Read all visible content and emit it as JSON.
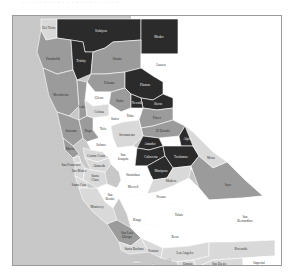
{
  "figure": {
    "caption_top": "· · · · · · · · · · · · · · · · · · · · · ·"
  },
  "legend_shades": {
    "dark": "#2b2b2b",
    "medium": "#9b9b9b",
    "light": "#d9d9d9",
    "white": "#ffffff",
    "ocean": "#c8c8c8",
    "border": "#8c8c8c"
  },
  "counties": [
    {
      "name": "Del Norte",
      "shade": "light"
    },
    {
      "name": "Siskiyou",
      "shade": "dark"
    },
    {
      "name": "Modoc",
      "shade": "dark"
    },
    {
      "name": "Humboldt",
      "shade": "medium"
    },
    {
      "name": "Trinity",
      "shade": "dark"
    },
    {
      "name": "Shasta",
      "shade": "medium"
    },
    {
      "name": "Lassen",
      "shade": "white"
    },
    {
      "name": "Tehama",
      "shade": "medium"
    },
    {
      "name": "Plumas",
      "shade": "dark"
    },
    {
      "name": "Mendocino",
      "shade": "medium"
    },
    {
      "name": "Glenn",
      "shade": "white"
    },
    {
      "name": "Butte",
      "shade": "medium"
    },
    {
      "name": "Sierra",
      "shade": "dark"
    },
    {
      "name": "Lake",
      "shade": "medium"
    },
    {
      "name": "Colusa",
      "shade": "light"
    },
    {
      "name": "Yuba",
      "shade": "white"
    },
    {
      "name": "Nevada",
      "shade": "dark"
    },
    {
      "name": "Placer",
      "shade": "medium"
    },
    {
      "name": "Sutter",
      "shade": "white"
    },
    {
      "name": "Yolo",
      "shade": "white"
    },
    {
      "name": "Sonoma",
      "shade": "medium"
    },
    {
      "name": "Napa",
      "shade": "medium"
    },
    {
      "name": "El Dorado",
      "shade": "medium"
    },
    {
      "name": "Sacramento",
      "shade": "light"
    },
    {
      "name": "Solano",
      "shade": "white"
    },
    {
      "name": "Amador",
      "shade": "dark"
    },
    {
      "name": "Alpine",
      "shade": "dark"
    },
    {
      "name": "Marin",
      "shade": "medium"
    },
    {
      "name": "Contra Costa",
      "shade": "light"
    },
    {
      "name": "San Joaquin",
      "shade": "white"
    },
    {
      "name": "Calaveras",
      "shade": "dark"
    },
    {
      "name": "Tuolumne",
      "shade": "dark"
    },
    {
      "name": "Mono",
      "shade": "light"
    },
    {
      "name": "San Francisco",
      "shade": "light"
    },
    {
      "name": "Alameda",
      "shade": "light"
    },
    {
      "name": "Stanislaus",
      "shade": "white"
    },
    {
      "name": "Mariposa",
      "shade": "dark"
    },
    {
      "name": "San Mateo",
      "shade": "light"
    },
    {
      "name": "Santa Clara",
      "shade": "light"
    },
    {
      "name": "Merced",
      "shade": "white"
    },
    {
      "name": "Madera",
      "shade": "light"
    },
    {
      "name": "Santa Cruz",
      "shade": "light"
    },
    {
      "name": "San Benito",
      "shade": "white"
    },
    {
      "name": "Fresno",
      "shade": "white"
    },
    {
      "name": "Inyo",
      "shade": "medium"
    },
    {
      "name": "Monterey",
      "shade": "light"
    },
    {
      "name": "Kings",
      "shade": "white"
    },
    {
      "name": "Tulare",
      "shade": "white"
    },
    {
      "name": "San Luis Obispo",
      "shade": "medium"
    },
    {
      "name": "Kern",
      "shade": "white"
    },
    {
      "name": "San Bernardino",
      "shade": "white"
    },
    {
      "name": "Santa Barbara",
      "shade": "light"
    },
    {
      "name": "Ventura",
      "shade": "light"
    },
    {
      "name": "Los Angeles",
      "shade": "light"
    },
    {
      "name": "Orange",
      "shade": "light"
    },
    {
      "name": "Riverside",
      "shade": "light"
    },
    {
      "name": "San Diego",
      "shade": "light"
    },
    {
      "name": "Imperial",
      "shade": "white"
    }
  ],
  "labels": {
    "del_norte": "Del Norte",
    "siskiyou": "Siskiyou",
    "modoc": "Modoc",
    "humboldt": "Humboldt",
    "trinity": "Trinity",
    "shasta": "Shasta",
    "lassen": "Lassen",
    "tehama": "Tehama",
    "plumas": "Plumas",
    "mendocino": "Mendocino",
    "glenn": "Glenn",
    "butte": "Butte",
    "sierra": "Sierra",
    "lake": "Lake",
    "colusa": "Colusa",
    "yuba": "Yuba",
    "nevada": "Nevada",
    "placer": "Placer",
    "sutter": "Sutter",
    "yolo": "Yolo",
    "sonoma": "Sonoma",
    "napa": "Napa",
    "el_dorado": "El Dorado",
    "sacramento": "Sacramento",
    "solano": "Solano",
    "amador": "Amador",
    "alpine": "Alpine",
    "marin": "Marin",
    "contra_costa": "Contra Costa",
    "san_joaquin_1": "San",
    "san_joaquin_2": "Joaquin",
    "calaveras": "Calaveras",
    "tuolumne": "Tuolumne",
    "mono": "Mono",
    "san_francisco": "San Francisco",
    "alameda": "Alameda",
    "stanislaus": "Stanislaus",
    "mariposa": "Mariposa",
    "san_mateo": "San Mateo",
    "santa_clara_1": "Santa",
    "santa_clara_2": "Clara",
    "merced": "Merced",
    "madera": "Madera",
    "santa_cruz": "Santa Cruz",
    "san_benito_1": "San",
    "san_benito_2": "Benito",
    "fresno": "Fresno",
    "inyo": "Inyo",
    "monterey": "Monterey",
    "kings": "Kings",
    "tulare": "Tulare",
    "slo_1": "San Luis",
    "slo_2": "Obispo",
    "kern": "Kern",
    "san_bernardino_1": "San",
    "san_bernardino_2": "Bernardino",
    "santa_barbara": "Santa Barbara",
    "ventura": "Ventura",
    "los_angeles": "Los Angeles",
    "orange": "Orange",
    "riverside": "Riverside",
    "san_diego": "San Diego",
    "imperial": "Imperial"
  }
}
